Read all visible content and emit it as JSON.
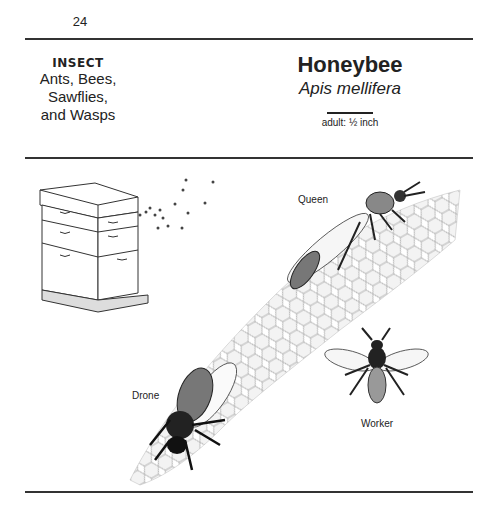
{
  "page": {
    "number": "24"
  },
  "classification": {
    "category": "INSECT",
    "group_lines": [
      "Ants, Bees,",
      "Sawflies,",
      "and Wasps"
    ]
  },
  "species": {
    "common_name": "Honeybee",
    "scientific_name": "Apis mellifera",
    "size_label": "adult: ½ inch"
  },
  "illustration": {
    "labels": {
      "queen": "Queen",
      "drone": "Drone",
      "worker": "Worker"
    },
    "elements": [
      "beehive",
      "flying-bees",
      "honeycomb",
      "queen-bee",
      "drone-bee",
      "worker-bee"
    ]
  }
}
